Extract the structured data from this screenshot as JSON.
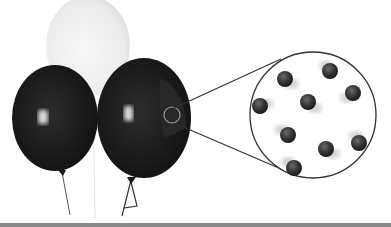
{
  "figure": {
    "balloons": [
      {
        "id": "white-balloon",
        "color": "#efefef",
        "cx": 88,
        "cy": 46,
        "rx": 42,
        "ry": 50
      },
      {
        "id": "left-dark-balloon",
        "color": "#1a1a1a",
        "cx": 55,
        "cy": 118,
        "rx": 43,
        "ry": 53
      },
      {
        "id": "right-dark-balloon",
        "color": "#161616",
        "cx": 144,
        "cy": 118,
        "rx": 47,
        "ry": 60
      }
    ],
    "magnifier": {
      "cx": 313,
      "cy": 115,
      "r": 63,
      "stroke": "#333333"
    },
    "focus_circle": {
      "cx": 172,
      "cy": 115,
      "r": 8
    },
    "particles": [
      {
        "x": 285,
        "y": 79
      },
      {
        "x": 330,
        "y": 71
      },
      {
        "x": 353,
        "y": 93
      },
      {
        "x": 259,
        "y": 106
      },
      {
        "x": 308,
        "y": 102
      },
      {
        "x": 288,
        "y": 135
      },
      {
        "x": 326,
        "y": 149
      },
      {
        "x": 359,
        "y": 143
      },
      {
        "x": 294,
        "y": 168
      }
    ],
    "particle_color": "#2e2e2e"
  }
}
